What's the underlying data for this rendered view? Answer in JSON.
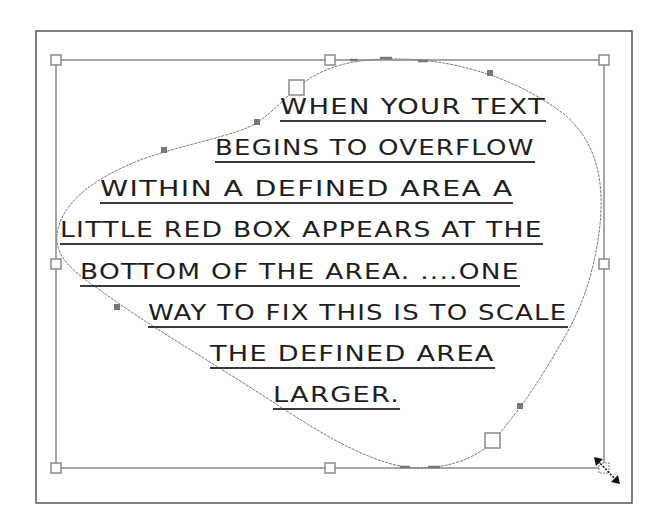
{
  "document": {
    "text_frame": {
      "lines": [
        "WHEN YOUR TEXT",
        "BEGINS TO OVERFLOW",
        "WITHIN A DEFINED AREA A",
        "LITTLE RED BOX APPEARS AT THE",
        "BOTTOM OF THE AREA. ....ONE",
        "WAY TO FIX THIS IS TO SCALE",
        "THE DEFINED AREA",
        "LARGER."
      ]
    },
    "selection": {
      "handles": [
        "top-left",
        "top-middle",
        "top-right",
        "middle-left",
        "middle-right",
        "bottom-left",
        "bottom-middle",
        "bottom-right"
      ],
      "cursor": "diagonal-resize-icon"
    }
  },
  "colors": {
    "frame_stroke": "#555555",
    "bbox_stroke": "#8a8a8a",
    "path_stroke": "#7a7a7a",
    "control_point_fill": "#777777",
    "text": "#1e1e1e",
    "cursor": "#111111"
  }
}
